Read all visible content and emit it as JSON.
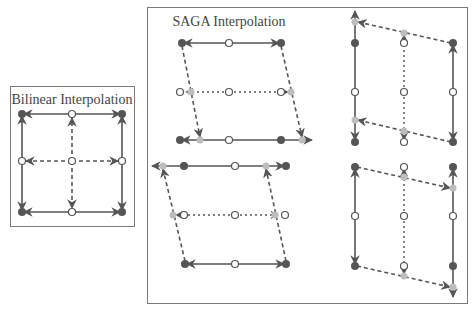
{
  "bilinear": {
    "title": "Bilinear Interpolation"
  },
  "saga": {
    "title": "SAGA Interpolation"
  },
  "colors": {
    "line": "#555555",
    "frame": "#7a7a7a",
    "filled_dot": "#555555",
    "open_dot_fill": "#ffffff",
    "ghost_dot": "#bdbdbd",
    "title": "#444444"
  }
}
